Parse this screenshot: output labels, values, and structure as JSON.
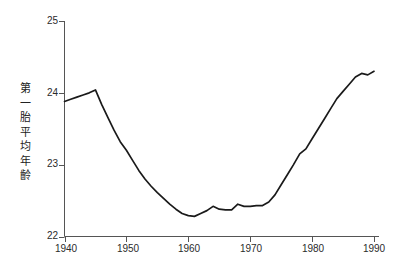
{
  "chart_data": {
    "type": "line",
    "title": "",
    "xlabel": "",
    "ylabel": "第一胎平均年齡",
    "ylabel_chars": [
      "第",
      "一",
      "胎",
      "平",
      "均",
      "年",
      "齡"
    ],
    "xlim": [
      1940,
      1990
    ],
    "ylim": [
      22,
      25
    ],
    "yticks": [
      22,
      23,
      24,
      25
    ],
    "ytick_labels": [
      "22",
      "23",
      "24",
      "25"
    ],
    "xticks": [
      1940,
      1950,
      1960,
      1970,
      1980,
      1990
    ],
    "xtick_labels": [
      "1940",
      "1950",
      "1960",
      "1970",
      "1980",
      "1990"
    ],
    "grid": false,
    "legend": "none",
    "line_color": "#1a1a1a",
    "axis_color": "#555555",
    "background_color": "#ffffff",
    "x": [
      1940,
      1941,
      1942,
      1943,
      1944,
      1945,
      1946,
      1947,
      1948,
      1949,
      1950,
      1951,
      1952,
      1953,
      1954,
      1955,
      1956,
      1957,
      1958,
      1959,
      1960,
      1961,
      1962,
      1963,
      1964,
      1965,
      1966,
      1967,
      1968,
      1969,
      1970,
      1971,
      1972,
      1973,
      1974,
      1975,
      1976,
      1977,
      1978,
      1979,
      1980,
      1981,
      1982,
      1983,
      1984,
      1985,
      1986,
      1987,
      1988,
      1989,
      1990
    ],
    "values": [
      23.88,
      23.91,
      23.94,
      23.97,
      24.0,
      24.04,
      23.84,
      23.66,
      23.48,
      23.32,
      23.2,
      23.06,
      22.92,
      22.8,
      22.7,
      22.61,
      22.53,
      22.45,
      22.38,
      22.32,
      22.29,
      22.28,
      22.32,
      22.36,
      22.42,
      22.38,
      22.37,
      22.37,
      22.45,
      22.42,
      22.42,
      22.43,
      22.43,
      22.48,
      22.58,
      22.72,
      22.86,
      23.0,
      23.15,
      23.22,
      23.36,
      23.5,
      23.64,
      23.78,
      23.92,
      24.02,
      24.12,
      24.22,
      24.27,
      24.25,
      24.3
    ]
  }
}
